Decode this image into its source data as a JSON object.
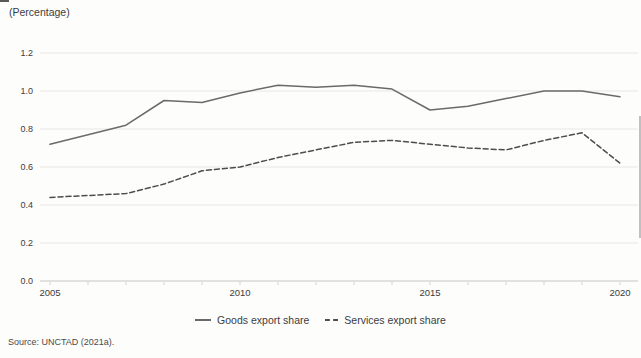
{
  "header": {
    "unit_label": "(Percentage)"
  },
  "footer": {
    "source": "Source: UNCTAD (2021a)."
  },
  "legend": {
    "items": [
      {
        "label": "Goods export share",
        "style": "solid"
      },
      {
        "label": "Services export share",
        "style": "dashed"
      }
    ]
  },
  "axes": {
    "y_tick_labels": [
      "0.0",
      "0.2",
      "0.4",
      "0.6",
      "0.8",
      "1.0",
      "1.2"
    ],
    "x_tick_labels": [
      "2005",
      "2010",
      "2015",
      "2020"
    ]
  },
  "colors": {
    "goods_line": "#6a6a6a",
    "services_line": "#4d4d4d",
    "gridline": "#e9e7e3",
    "axis_line": "#c7c5c0",
    "tick_mark": "#d4d2ce",
    "text": "#3c3c3c"
  },
  "chart_data": {
    "type": "line",
    "title": "",
    "xlabel": "",
    "ylabel": "(Percentage)",
    "x": [
      2005,
      2006,
      2007,
      2008,
      2009,
      2010,
      2011,
      2012,
      2013,
      2014,
      2015,
      2016,
      2017,
      2018,
      2019,
      2020
    ],
    "series": [
      {
        "name": "Goods export share",
        "style": "solid",
        "values": [
          0.72,
          0.77,
          0.82,
          0.95,
          0.94,
          0.99,
          1.03,
          1.02,
          1.03,
          1.01,
          0.9,
          0.92,
          0.96,
          1.0,
          1.0,
          0.97
        ]
      },
      {
        "name": "Services export share",
        "style": "dashed",
        "values": [
          0.44,
          0.45,
          0.46,
          0.51,
          0.58,
          0.6,
          0.65,
          0.69,
          0.73,
          0.74,
          0.72,
          0.7,
          0.69,
          0.74,
          0.78,
          0.62
        ]
      }
    ],
    "ylim": [
      0,
      1.2
    ],
    "yticks": [
      0,
      0.2,
      0.4,
      0.6,
      0.8,
      1.0,
      1.2
    ],
    "xticks": [
      2005,
      2010,
      2015,
      2020
    ],
    "grid": true,
    "legend_position": "bottom"
  }
}
